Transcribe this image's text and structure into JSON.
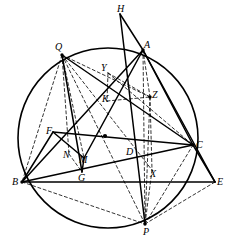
{
  "figure": {
    "width": 234,
    "height": 252,
    "background_color": "#ffffff",
    "stroke_color": "#000000"
  },
  "circle": {
    "name": "circumcircle",
    "cx": 108,
    "cy": 138,
    "r": 90,
    "stroke_color": "#000000",
    "stroke_width": 1.6,
    "fill": "none"
  },
  "points": [
    {
      "id": "H",
      "label": "H",
      "x": 120,
      "y": 14,
      "lx": 117,
      "ly": 4,
      "on_circle": false,
      "dot": false
    },
    {
      "id": "Q",
      "label": "Q",
      "x": 62,
      "y": 55,
      "lx": 55,
      "ly": 42,
      "on_circle": true,
      "dot": true
    },
    {
      "id": "A",
      "label": "A",
      "x": 143,
      "y": 50,
      "lx": 144,
      "ly": 40,
      "on_circle": true,
      "dot": true
    },
    {
      "id": "Y",
      "label": "Y",
      "x": 108,
      "y": 73,
      "lx": 101,
      "ly": 63,
      "on_circle": false,
      "dot": false
    },
    {
      "id": "K",
      "label": "K",
      "x": 107,
      "y": 101,
      "lx": 102,
      "ly": 94,
      "on_circle": false,
      "dot": false
    },
    {
      "id": "Z",
      "label": "Z",
      "x": 150,
      "y": 97,
      "lx": 152,
      "ly": 90,
      "on_circle": false,
      "dot": true
    },
    {
      "id": "F",
      "label": "F",
      "x": 53,
      "y": 132,
      "lx": 46,
      "ly": 126,
      "on_circle": false,
      "dot": false
    },
    {
      "id": "C",
      "label": "C",
      "x": 193,
      "y": 145,
      "lx": 196,
      "ly": 140,
      "on_circle": true,
      "dot": true
    },
    {
      "id": "N",
      "label": "N",
      "x": 69,
      "y": 154,
      "lx": 63,
      "ly": 150,
      "on_circle": false,
      "dot": false
    },
    {
      "id": "M",
      "label": "M",
      "x": 84,
      "y": 158,
      "lx": 79,
      "ly": 155,
      "on_circle": false,
      "dot": false
    },
    {
      "id": "D",
      "label": "D",
      "x": 130,
      "y": 153,
      "lx": 126,
      "ly": 147,
      "on_circle": false,
      "dot": false
    },
    {
      "id": "B",
      "label": "B",
      "x": 22,
      "y": 182,
      "lx": 12,
      "ly": 177,
      "on_circle": true,
      "dot": true
    },
    {
      "id": "G",
      "label": "G",
      "x": 82,
      "y": 172,
      "lx": 78,
      "ly": 173,
      "on_circle": false,
      "dot": false
    },
    {
      "id": "X",
      "label": "X",
      "x": 152,
      "y": 170,
      "lx": 150,
      "ly": 169,
      "on_circle": false,
      "dot": false
    },
    {
      "id": "E",
      "label": "E",
      "x": 215,
      "y": 182,
      "lx": 217,
      "ly": 177,
      "on_circle": false,
      "dot": false
    },
    {
      "id": "P",
      "label": "P",
      "x": 145,
      "y": 224,
      "lx": 143,
      "ly": 227,
      "on_circle": true,
      "dot": true
    }
  ],
  "segments_solid": [
    {
      "name": "H-A",
      "from": "H",
      "to": "A"
    },
    {
      "name": "H-P",
      "from": "H",
      "to": "P"
    },
    {
      "name": "Q-G",
      "from": "Q",
      "to": "G"
    },
    {
      "name": "Q-C",
      "from": "Q",
      "to": "C"
    },
    {
      "name": "A-B",
      "from": "A",
      "to": "B"
    },
    {
      "name": "A-C",
      "from": "A",
      "to": "C"
    },
    {
      "name": "A-E",
      "from": "A",
      "to": "E"
    },
    {
      "name": "B-C",
      "from": "B",
      "to": "C"
    },
    {
      "name": "B-F",
      "from": "B",
      "to": "F"
    },
    {
      "name": "F-C",
      "from": "F",
      "to": "C"
    },
    {
      "name": "C-E",
      "from": "C",
      "to": "E"
    },
    {
      "name": "B-E",
      "from": "B",
      "to": "E"
    },
    {
      "name": "F-M",
      "from": "F",
      "to": "M"
    },
    {
      "name": "G-M",
      "from": "G",
      "to": "M"
    },
    {
      "name": "M-A",
      "from": "M",
      "to": "A"
    }
  ],
  "segments_dashed": [
    {
      "name": "Q-B",
      "from": "Q",
      "to": "B"
    },
    {
      "name": "Q-N",
      "from": "Q",
      "to": "N"
    },
    {
      "name": "Q-M",
      "from": "Q",
      "to": "M"
    },
    {
      "name": "Q-Z",
      "from": "Q",
      "to": "Z"
    },
    {
      "name": "Q-P",
      "from": "Q",
      "to": "P"
    },
    {
      "name": "Q-X",
      "from": "Q",
      "to": "X"
    },
    {
      "name": "A-P",
      "from": "A",
      "to": "P"
    },
    {
      "name": "A-Z",
      "from": "A",
      "to": "Z"
    },
    {
      "name": "Z-P",
      "from": "Z",
      "to": "P"
    },
    {
      "name": "Z-X",
      "from": "Z",
      "to": "X"
    },
    {
      "name": "X-P",
      "from": "X",
      "to": "P"
    },
    {
      "name": "Y-Z",
      "from": "Y",
      "to": "Z"
    },
    {
      "name": "Y-C",
      "from": "Y",
      "to": "C"
    },
    {
      "name": "K-Z",
      "from": "K",
      "to": "Z"
    },
    {
      "name": "B-P",
      "from": "B",
      "to": "P"
    },
    {
      "name": "P-E",
      "from": "P",
      "to": "E"
    },
    {
      "name": "P-C",
      "from": "P",
      "to": "C"
    },
    {
      "name": "N-G",
      "from": "N",
      "to": "G"
    },
    {
      "name": "Y-K",
      "from": "Y",
      "to": "K"
    }
  ],
  "markers": [
    {
      "name": "center-arrow-marker",
      "x": 105,
      "y": 136
    }
  ],
  "style": {
    "solid_width": 1.5,
    "dashed_width": 0.8,
    "dash_pattern": "3,2.6",
    "dot_radius": 1.7,
    "label_font_size": 10
  }
}
